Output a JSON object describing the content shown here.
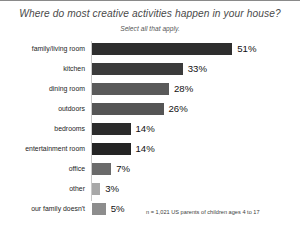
{
  "chart_data": {
    "type": "bar",
    "orientation": "horizontal",
    "title": "Where do most creative activities happen in your house?",
    "subtitle": "Select all that apply.",
    "xlabel": "",
    "ylabel": "",
    "xlim": [
      0,
      51
    ],
    "grid": false,
    "legend": false,
    "value_suffix": "%",
    "note": "n = 1,021 US parents of children ages 4 to 17",
    "categories": [
      "family/living room",
      "kitchen",
      "dining room",
      "outdoors",
      "bedrooms",
      "entertainment room",
      "office",
      "other",
      "our family doesn't"
    ],
    "values": [
      51,
      33,
      28,
      26,
      14,
      14,
      7,
      3,
      5
    ],
    "value_labels": [
      "51%",
      "33%",
      "28%",
      "26%",
      "14%",
      "14%",
      "7%",
      "3%",
      "5%"
    ],
    "bar_colors": [
      "#2e2e2e",
      "#3b3b3b",
      "#5a5a5a",
      "#555555",
      "#2b2b2b",
      "#242424",
      "#6a6a6a",
      "#a8a8a8",
      "#8d8d8d"
    ]
  },
  "colors": {
    "background": "#ffffff",
    "title": "#4a4a4a",
    "axis": "#c9c9c9",
    "border": "#8a8a8a",
    "text": "#111111"
  }
}
